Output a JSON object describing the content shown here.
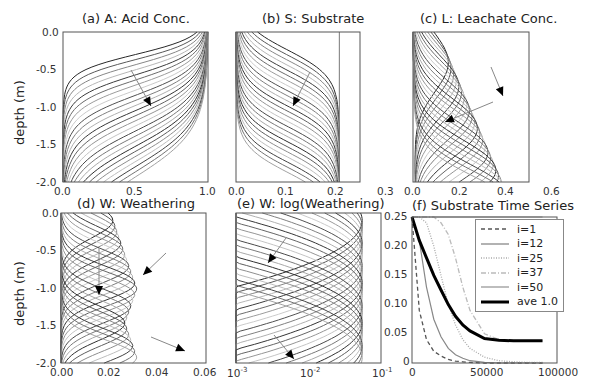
{
  "figure": {
    "ylabel_top": "depth (m)",
    "ylabel_bottom": "depth (m)"
  },
  "chart_data": [
    {
      "id": "a",
      "type": "line",
      "title": "(a) A: Acid Conc.",
      "xlabel": "",
      "ylabel": "depth (m)",
      "xlim": [
        0.0,
        1.0
      ],
      "ylim": [
        -2.0,
        0.0
      ],
      "xticks": [
        "0.0",
        "0.5",
        "1.0"
      ],
      "yticks": [
        "0.0",
        "-0.5",
        "-1.0",
        "-1.5",
        "-2.0"
      ],
      "description": "Family of ~25 grayscale profiles; acid concentration front moves downward with time (arrow pointing down-right).",
      "series_count": 25
    },
    {
      "id": "b",
      "type": "line",
      "title": "(b) S: Substrate",
      "xlim": [
        0.0,
        0.3
      ],
      "ylim": [
        -2.0,
        0.0
      ],
      "xticks": [
        "0.0",
        "0.1",
        "0.2",
        "0.3"
      ],
      "description": "Substrate profiles decreasing from 0.25 at depth; front migrates downward over time (arrow).",
      "series_count": 25
    },
    {
      "id": "c",
      "type": "line",
      "title": "(c) L: Leachate Conc.",
      "xlim": [
        0.0,
        0.6
      ],
      "ylim": [
        -2.0,
        0.0
      ],
      "xticks": [
        "0.0",
        "0.2",
        "0.4",
        "0.6"
      ],
      "description": "Leachate concentration bulges moving downward; two arrows indicate evolution.",
      "series_count": 25
    },
    {
      "id": "d",
      "type": "line",
      "title": "(d) W: Weathering",
      "xlabel": "",
      "ylabel": "depth (m)",
      "xlim": [
        0.0,
        0.06
      ],
      "ylim": [
        -2.0,
        0.0
      ],
      "xticks": [
        "0.00",
        "0.02",
        "0.04",
        "0.06"
      ],
      "yticks": [
        "0.0",
        "-0.5",
        "-1.0",
        "-1.5",
        "-2.0"
      ],
      "description": "Weathering rate peaks migrating downward; three arrows.",
      "series_count": 25
    },
    {
      "id": "e",
      "type": "line",
      "title": "(e) W: log(Weathering)",
      "xscale": "log",
      "xlim": [
        0.001,
        0.1
      ],
      "ylim": [
        -2.0,
        0.0
      ],
      "xticks": [
        "10^-3",
        "10^-2",
        "10^-1"
      ],
      "description": "Same weathering profiles on log x-axis; two arrows.",
      "series_count": 25
    },
    {
      "id": "f",
      "type": "line",
      "title": "(f) Substrate Time Series",
      "xlim": [
        0,
        100000
      ],
      "ylim": [
        0,
        0.25
      ],
      "xticks": [
        "0",
        "50000",
        "100000"
      ],
      "yticks": [
        "0",
        "0.05",
        "0.10",
        "0.15",
        "0.20",
        "0.25"
      ],
      "legend_position": "upper right",
      "x": [
        0,
        5000,
        10000,
        15000,
        20000,
        25000,
        30000,
        35000,
        40000,
        50000,
        60000,
        70000,
        80000,
        90000
      ],
      "series": [
        {
          "name": "i=1",
          "style": "dashed",
          "values": [
            0.25,
            0.09,
            0.04,
            0.02,
            0.012,
            0.006,
            0.003,
            0.002,
            0.001,
            0,
            0,
            0,
            0,
            0
          ]
        },
        {
          "name": "i=12",
          "style": "solid",
          "values": [
            0.25,
            0.21,
            0.13,
            0.075,
            0.045,
            0.025,
            0.014,
            0.008,
            0.004,
            0.001,
            0,
            0,
            0,
            0
          ]
        },
        {
          "name": "i=25",
          "style": "dotted",
          "values": [
            0.25,
            0.25,
            0.24,
            0.2,
            0.15,
            0.1,
            0.065,
            0.04,
            0.025,
            0.01,
            0.004,
            0.002,
            0.001,
            0.001
          ]
        },
        {
          "name": "i=37",
          "style": "dashdot",
          "values": [
            0.25,
            0.25,
            0.25,
            0.25,
            0.24,
            0.22,
            0.18,
            0.13,
            0.09,
            0.05,
            0.04,
            0.038,
            0.038,
            0.038
          ]
        },
        {
          "name": "i=50",
          "style": "solid-light",
          "values": [
            0.25,
            0.25,
            0.25,
            0.25,
            0.25,
            0.25,
            0.25,
            0.25,
            0.25,
            0.25,
            0.25,
            0.25,
            0.25,
            0.25
          ]
        },
        {
          "name": "ave 1.0",
          "style": "thick",
          "values": [
            0.25,
            0.21,
            0.18,
            0.15,
            0.125,
            0.1,
            0.08,
            0.065,
            0.055,
            0.042,
            0.039,
            0.038,
            0.038,
            0.038
          ]
        }
      ]
    }
  ]
}
